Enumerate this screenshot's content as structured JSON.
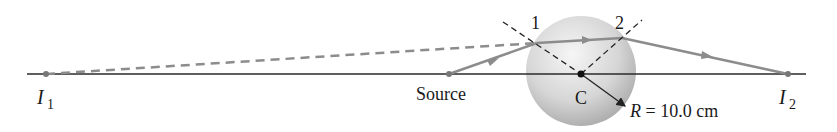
{
  "labels": {
    "image1": "I",
    "image1_sub": "1",
    "image2": "I",
    "image2_sub": "2",
    "source": "Source",
    "center": "C",
    "point1": "1",
    "point2": "2",
    "radius_var": "R",
    "radius_value": " = 10.0 cm"
  },
  "colors": {
    "axis": "#2a2a2a",
    "ray": "#8c8c8c",
    "sphere_light": "#f4f4f4",
    "sphere_dark": "#a9a9a9",
    "normals": "#222222"
  }
}
